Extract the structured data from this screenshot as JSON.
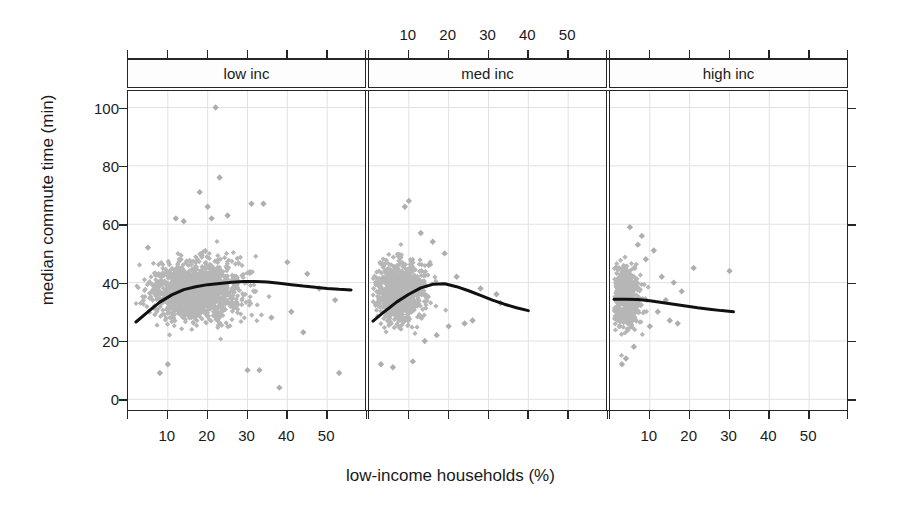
{
  "chart_data": {
    "type": "scatter",
    "title": "",
    "xlabel": "low-income households (%)",
    "ylabel": "median commute time (min)",
    "xlim": [
      0,
      60
    ],
    "ylim": [
      -4,
      106
    ],
    "xticks": [
      10,
      20,
      30,
      40,
      50
    ],
    "yticks": [
      0,
      20,
      40,
      60,
      80,
      100
    ],
    "grid": true,
    "legend": "none",
    "layout": "lattice 1x3 conditioned panels, shared y axis",
    "axis_label_placement": "x tick labels below panel 1 and panel 3, above panel 2",
    "marker": {
      "shape": "diamond",
      "color": "#b4b4b4",
      "size": 4
    },
    "trend_line": {
      "color": "#111111",
      "width": 3,
      "type": "loess-smoother"
    },
    "panels": [
      {
        "name": "low inc",
        "strip_label": "low inc",
        "x_range_data": [
          2,
          57
        ],
        "smoother": {
          "x": [
            2,
            5,
            8,
            11,
            14,
            17,
            20,
            23,
            26,
            29,
            32,
            35,
            38,
            41,
            44,
            47,
            50,
            53,
            56
          ],
          "y": [
            26.5,
            30.0,
            33.3,
            35.8,
            37.6,
            38.6,
            39.3,
            39.7,
            40.1,
            40.4,
            40.4,
            40.2,
            39.8,
            39.3,
            38.8,
            38.4,
            38.0,
            37.7,
            37.5
          ]
        },
        "cloud": {
          "x_center": 17,
          "x_spread": 9,
          "x_min": 2,
          "x_max": 45,
          "y_center": 37,
          "y_spread": 8,
          "y_min": 8,
          "y_max": 62,
          "n": 1400
        },
        "outliers": [
          {
            "x": 22,
            "y": 100
          },
          {
            "x": 23,
            "y": 76
          },
          {
            "x": 18,
            "y": 71
          },
          {
            "x": 31,
            "y": 67
          },
          {
            "x": 34,
            "y": 67
          },
          {
            "x": 20,
            "y": 66
          },
          {
            "x": 12,
            "y": 62
          },
          {
            "x": 14,
            "y": 61
          },
          {
            "x": 21,
            "y": 62
          },
          {
            "x": 25,
            "y": 63
          },
          {
            "x": 40,
            "y": 47
          },
          {
            "x": 45,
            "y": 43
          },
          {
            "x": 48,
            "y": 38
          },
          {
            "x": 52,
            "y": 34
          },
          {
            "x": 30,
            "y": 10
          },
          {
            "x": 33,
            "y": 10
          },
          {
            "x": 38,
            "y": 4
          },
          {
            "x": 53,
            "y": 9
          },
          {
            "x": 8,
            "y": 9
          },
          {
            "x": 10,
            "y": 12
          },
          {
            "x": 44,
            "y": 23
          },
          {
            "x": 41,
            "y": 30
          },
          {
            "x": 36,
            "y": 28
          },
          {
            "x": 5,
            "y": 52
          }
        ]
      },
      {
        "name": "med inc",
        "strip_label": "med inc",
        "x_range_data": [
          1,
          42
        ],
        "smoother": {
          "x": [
            1,
            4,
            7,
            10,
            13,
            16,
            19,
            22,
            25,
            28,
            31,
            34,
            37,
            40
          ],
          "y": [
            26.8,
            30.2,
            33.4,
            36.0,
            38.2,
            39.4,
            39.6,
            38.6,
            37.2,
            35.6,
            34.0,
            32.6,
            31.4,
            30.4
          ]
        },
        "cloud": {
          "x_center": 8,
          "x_spread": 5,
          "x_min": 1,
          "x_max": 26,
          "y_center": 37,
          "y_spread": 8,
          "y_min": 10,
          "y_max": 64,
          "n": 900
        },
        "outliers": [
          {
            "x": 10,
            "y": 68
          },
          {
            "x": 9,
            "y": 66
          },
          {
            "x": 13,
            "y": 57
          },
          {
            "x": 16,
            "y": 54
          },
          {
            "x": 19,
            "y": 50
          },
          {
            "x": 15,
            "y": 46
          },
          {
            "x": 22,
            "y": 42
          },
          {
            "x": 28,
            "y": 38
          },
          {
            "x": 32,
            "y": 36
          },
          {
            "x": 26,
            "y": 27
          },
          {
            "x": 20,
            "y": 25
          },
          {
            "x": 24,
            "y": 26
          },
          {
            "x": 33,
            "y": 33
          },
          {
            "x": 17,
            "y": 22
          },
          {
            "x": 14,
            "y": 20
          },
          {
            "x": 11,
            "y": 13
          },
          {
            "x": 3,
            "y": 12
          },
          {
            "x": 6,
            "y": 11
          }
        ]
      },
      {
        "name": "high inc",
        "strip_label": "high inc",
        "x_range_data": [
          1,
          33
        ],
        "smoother": {
          "x": [
            1,
            4,
            7,
            10,
            13,
            16,
            19,
            22,
            25,
            28,
            31
          ],
          "y": [
            34.3,
            34.3,
            34.2,
            33.8,
            33.2,
            32.6,
            32.0,
            31.4,
            30.9,
            30.4,
            30.0
          ]
        },
        "cloud": {
          "x_center": 4,
          "x_spread": 3,
          "x_min": 1,
          "x_max": 16,
          "y_center": 35,
          "y_spread": 8,
          "y_min": 11,
          "y_max": 60,
          "n": 600
        },
        "outliers": [
          {
            "x": 5,
            "y": 59
          },
          {
            "x": 8,
            "y": 56
          },
          {
            "x": 7,
            "y": 53
          },
          {
            "x": 11,
            "y": 51
          },
          {
            "x": 9,
            "y": 48
          },
          {
            "x": 21,
            "y": 45
          },
          {
            "x": 13,
            "y": 42
          },
          {
            "x": 16,
            "y": 40
          },
          {
            "x": 18,
            "y": 37
          },
          {
            "x": 14,
            "y": 34
          },
          {
            "x": 12,
            "y": 30
          },
          {
            "x": 15,
            "y": 27
          },
          {
            "x": 10,
            "y": 25
          },
          {
            "x": 17,
            "y": 26
          },
          {
            "x": 6,
            "y": 18
          },
          {
            "x": 4,
            "y": 14
          },
          {
            "x": 3,
            "y": 12
          },
          {
            "x": 30,
            "y": 44
          }
        ]
      }
    ]
  },
  "axis_titles": {
    "y": "median commute time (min)",
    "x": "low-income households (%)"
  }
}
